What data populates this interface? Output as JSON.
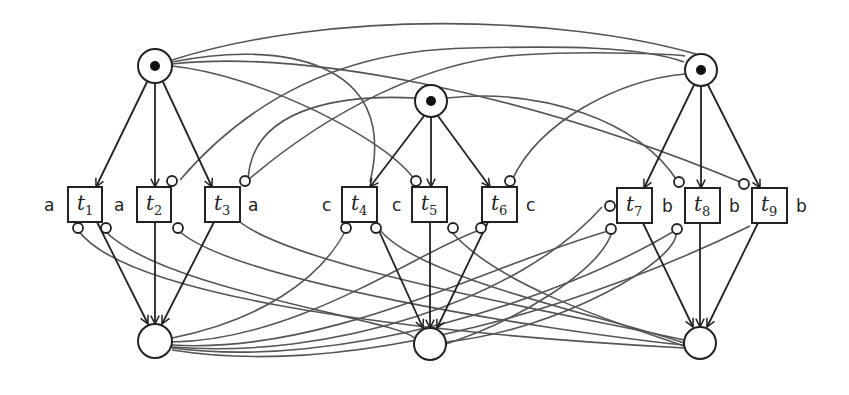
{
  "diagram": {
    "type": "petri-net",
    "places": [
      {
        "id": "p1",
        "cx": 155,
        "cy": 66,
        "r": 17,
        "tokens": 1
      },
      {
        "id": "p2",
        "cx": 431,
        "cy": 101,
        "r": 16,
        "tokens": 1
      },
      {
        "id": "p3",
        "cx": 701,
        "cy": 70,
        "r": 16,
        "tokens": 1
      },
      {
        "id": "p4",
        "cx": 155,
        "cy": 341,
        "r": 17,
        "tokens": 0
      },
      {
        "id": "p5",
        "cx": 430,
        "cy": 344,
        "r": 16,
        "tokens": 0
      },
      {
        "id": "p6",
        "cx": 700,
        "cy": 343,
        "r": 16,
        "tokens": 0
      }
    ],
    "transitions": [
      {
        "id": "t1",
        "name": "t",
        "sub": "1",
        "x": 68,
        "y": 187,
        "w": 34,
        "h": 35,
        "action": "a",
        "action_side": "left"
      },
      {
        "id": "t2",
        "name": "t",
        "sub": "2",
        "x": 137,
        "y": 187,
        "w": 34,
        "h": 35,
        "action": "a",
        "action_side": "left"
      },
      {
        "id": "t3",
        "name": "t",
        "sub": "3",
        "x": 205,
        "y": 187,
        "w": 35,
        "h": 35,
        "action": "a",
        "action_side": "right"
      },
      {
        "id": "t4",
        "name": "t",
        "sub": "4",
        "x": 342,
        "y": 187,
        "w": 35,
        "h": 35,
        "action": "c",
        "action_side": "left"
      },
      {
        "id": "t5",
        "name": "t",
        "sub": "5",
        "x": 412,
        "y": 187,
        "w": 35,
        "h": 35,
        "action": "c",
        "action_side": "left"
      },
      {
        "id": "t6",
        "name": "t",
        "sub": "6",
        "x": 482,
        "y": 187,
        "w": 35,
        "h": 35,
        "action": "c",
        "action_side": "right"
      },
      {
        "id": "t7",
        "name": "t",
        "sub": "7",
        "x": 617,
        "y": 188,
        "w": 35,
        "h": 35,
        "action": "b",
        "action_side": "right"
      },
      {
        "id": "t8",
        "name": "t",
        "sub": "8",
        "x": 685,
        "y": 188,
        "w": 35,
        "h": 35,
        "action": "b",
        "action_side": "right"
      },
      {
        "id": "t9",
        "name": "t",
        "sub": "9",
        "x": 752,
        "y": 188,
        "w": 35,
        "h": 35,
        "action": "b",
        "action_side": "right"
      }
    ],
    "labels": {
      "t1": {
        "name": "t",
        "sub": "1",
        "action": "a"
      },
      "t2": {
        "name": "t",
        "sub": "2",
        "action": "a"
      },
      "t3": {
        "name": "t",
        "sub": "3",
        "action": "a"
      },
      "t4": {
        "name": "t",
        "sub": "4",
        "action": "c"
      },
      "t5": {
        "name": "t",
        "sub": "5",
        "action": "c"
      },
      "t6": {
        "name": "t",
        "sub": "6",
        "action": "c"
      },
      "t7": {
        "name": "t",
        "sub": "7",
        "action": "b"
      },
      "t8": {
        "name": "t",
        "sub": "8",
        "action": "b"
      },
      "t9": {
        "name": "t",
        "sub": "9",
        "action": "b"
      }
    },
    "arcs": [
      {
        "from": "p1",
        "to": "t1",
        "kind": "normal"
      },
      {
        "from": "p1",
        "to": "t2",
        "kind": "normal"
      },
      {
        "from": "p1",
        "to": "t3",
        "kind": "normal"
      },
      {
        "from": "p2",
        "to": "t4",
        "kind": "normal"
      },
      {
        "from": "p2",
        "to": "t5",
        "kind": "normal"
      },
      {
        "from": "p2",
        "to": "t6",
        "kind": "normal"
      },
      {
        "from": "p3",
        "to": "t7",
        "kind": "normal"
      },
      {
        "from": "p3",
        "to": "t8",
        "kind": "normal"
      },
      {
        "from": "p3",
        "to": "t9",
        "kind": "normal"
      },
      {
        "from": "t1",
        "to": "p4",
        "kind": "normal"
      },
      {
        "from": "t2",
        "to": "p4",
        "kind": "normal"
      },
      {
        "from": "t3",
        "to": "p4",
        "kind": "normal"
      },
      {
        "from": "t4",
        "to": "p5",
        "kind": "normal"
      },
      {
        "from": "t5",
        "to": "p5",
        "kind": "normal"
      },
      {
        "from": "t6",
        "to": "p5",
        "kind": "normal"
      },
      {
        "from": "t7",
        "to": "p6",
        "kind": "normal"
      },
      {
        "from": "t8",
        "to": "p6",
        "kind": "normal"
      },
      {
        "from": "t9",
        "to": "p6",
        "kind": "normal"
      }
    ],
    "inhibitor_arc_count": 18
  }
}
